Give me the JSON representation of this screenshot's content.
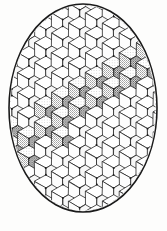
{
  "figure": {
    "kind": "line-drawing",
    "caption": "",
    "background_color": "#fdfdfc",
    "ink_color": "#1a1a1a",
    "shade_color": "#8d8d8d",
    "canvas": {
      "width": 167,
      "height": 231
    }
  },
  "ellipse": {
    "name": "outer-ellipse-boundary",
    "center_x": 83,
    "center_y": 108,
    "radius_x": 74,
    "radius_y": 104,
    "stroke_width": 1.6,
    "stroke_color": "#1a1a1a",
    "fill": "none"
  },
  "lattice": {
    "description": "Isometric cube (tumbling-blocks) lattice clipped to the ellipse",
    "cube_width": 22.6,
    "cube_half_width": 11.3,
    "cube_rise": 6.6,
    "column_step_x": 16.95,
    "row_step_y": 19.8,
    "line_width": 0.75,
    "vertex_dot_radius": 0.95,
    "columns": 13,
    "rows": 15,
    "origin_x": -22,
    "origin_y": -10
  },
  "shading": {
    "pattern": "fine-stipple-dots",
    "dot_spacing": 1.9,
    "dot_radius": 0.42,
    "dot_color": "#4a4a4a",
    "top_face_tone": "#ffffff",
    "left_face_tone": "#b9b9b9",
    "right_face_tone": "#9a9a9a",
    "band_direction": "lower-left to upper-right",
    "shaded_cube_cells": [
      [
        1,
        8
      ],
      [
        1,
        9
      ],
      [
        2,
        8
      ],
      [
        2,
        9
      ],
      [
        2,
        7
      ],
      [
        3,
        7
      ],
      [
        3,
        8
      ],
      [
        4,
        6
      ],
      [
        4,
        7
      ],
      [
        5,
        6
      ],
      [
        5,
        7
      ],
      [
        5,
        5
      ],
      [
        6,
        5
      ],
      [
        6,
        6
      ],
      [
        7,
        5
      ],
      [
        7,
        4
      ],
      [
        8,
        4
      ],
      [
        8,
        5
      ],
      [
        9,
        3
      ],
      [
        9,
        4
      ],
      [
        10,
        3
      ],
      [
        10,
        4
      ],
      [
        10,
        2
      ],
      [
        11,
        2
      ],
      [
        11,
        3
      ],
      [
        12,
        2
      ],
      [
        12,
        3
      ]
    ]
  },
  "labels": {
    "figure_name": "rhombille-ellipse-figure"
  }
}
